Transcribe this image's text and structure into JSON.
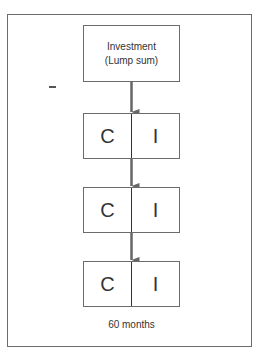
{
  "diagram": {
    "top_box": {
      "line1": "Investment",
      "line2": "(Lump sum)"
    },
    "boxes": [
      {
        "left": "C",
        "right": "I"
      },
      {
        "left": "C",
        "right": "I"
      },
      {
        "left": "C",
        "right": "I"
      }
    ],
    "caption": "60 months",
    "colors": {
      "border": "#6b6b6b",
      "arrow": "#666666",
      "text": "#333333"
    }
  }
}
